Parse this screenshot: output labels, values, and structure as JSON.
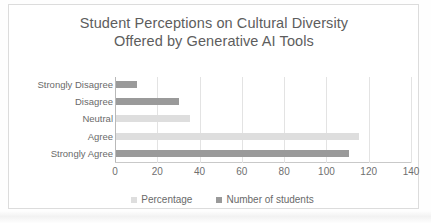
{
  "chart_data": {
    "type": "bar",
    "orientation": "horizontal",
    "title": "Student Perceptions on Cultural Diversity Offered by Generative AI Tools",
    "title_lines": [
      "Student Perceptions on Cultural Diversity",
      "Offered by Generative AI Tools"
    ],
    "categories": [
      "Strongly Disagree",
      "Disagree",
      "Neutral",
      "Agree",
      "Strongly Agree"
    ],
    "series": [
      {
        "name": "Percentage",
        "color": "#dedede",
        "values": [
          3,
          10,
          35,
          115,
          36
        ]
      },
      {
        "name": "Number of students",
        "color": "#9a9a9a",
        "values": [
          10,
          30,
          12,
          3,
          110
        ]
      }
    ],
    "xlabel": "",
    "ylabel": "",
    "xlim": [
      0,
      140
    ],
    "xticks": [
      0,
      20,
      40,
      60,
      80,
      100,
      120,
      140
    ],
    "xtick_labels": [
      "0",
      "20",
      "40",
      "60",
      "80",
      "100",
      "120",
      "140"
    ],
    "grid": true,
    "legend_position": "bottom",
    "bars_drawn": [
      {
        "category": "Strongly Disagree",
        "series": "Number of students",
        "value": 10
      },
      {
        "category": "Disagree",
        "series": "Number of students",
        "value": 30
      },
      {
        "category": "Neutral",
        "series": "Percentage",
        "value": 35
      },
      {
        "category": "Agree",
        "series": "Percentage",
        "value": 115
      },
      {
        "category": "Strongly Agree",
        "series": "Number of students",
        "value": 110
      }
    ]
  },
  "colors": {
    "percentage": "#dedede",
    "number_of_students": "#9a9a9a",
    "title_text": "#5d5d5d",
    "axis_text": "#6a6a6a",
    "gridline": "#e3e3e3",
    "frame_border": "#dcdcdc"
  }
}
